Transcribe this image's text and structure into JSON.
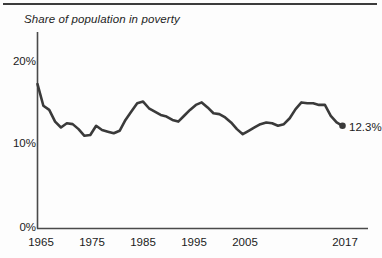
{
  "figure": {
    "title": "Share of population in poverty",
    "top_rule": "horizontal-divider",
    "background_color": "#fdfdfd",
    "line_color": "#3a3a3a",
    "axis_color": "#4a4a4a",
    "text_color": "#1b1b1b"
  },
  "annotations": {
    "end_value_label": "12.3%"
  },
  "chart_data": {
    "type": "line",
    "title": "Share of population in poverty",
    "xlabel": "",
    "ylabel": "",
    "xlim": [
      1965,
      2017
    ],
    "ylim": [
      0,
      21.5
    ],
    "grid": false,
    "legend": null,
    "x_tick_labels": [
      "1965",
      "1975",
      "1985",
      "1995",
      "2005",
      "2017"
    ],
    "x_ticks": [
      1965,
      1975,
      1985,
      1995,
      2005,
      2017
    ],
    "y_tick_labels": [
      "0%",
      "10%",
      "20%"
    ],
    "y_ticks": [
      0,
      10,
      20
    ],
    "series": [
      {
        "name": "Share of population in poverty",
        "units": "percent",
        "end_point_marker": true,
        "end_point_label": "12.3%",
        "x": [
          1965,
          1966,
          1967,
          1968,
          1969,
          1970,
          1971,
          1972,
          1973,
          1974,
          1975,
          1976,
          1977,
          1978,
          1979,
          1980,
          1981,
          1982,
          1983,
          1984,
          1985,
          1986,
          1987,
          1988,
          1989,
          1990,
          1991,
          1992,
          1993,
          1994,
          1995,
          1996,
          1997,
          1998,
          1999,
          2000,
          2001,
          2002,
          2003,
          2004,
          2005,
          2006,
          2007,
          2008,
          2009,
          2010,
          2011,
          2012,
          2013,
          2014,
          2015,
          2016,
          2017
        ],
        "values": [
          17.3,
          14.7,
          14.2,
          12.8,
          12.1,
          12.6,
          12.5,
          11.9,
          11.1,
          11.2,
          12.3,
          11.8,
          11.6,
          11.4,
          11.7,
          13.0,
          14.0,
          15.0,
          15.2,
          14.4,
          14.0,
          13.6,
          13.4,
          13.0,
          12.8,
          13.5,
          14.2,
          14.8,
          15.1,
          14.5,
          13.8,
          13.7,
          13.3,
          12.7,
          11.9,
          11.3,
          11.7,
          12.1,
          12.5,
          12.7,
          12.6,
          12.3,
          12.5,
          13.2,
          14.3,
          15.1,
          15.0,
          15.0,
          14.8,
          14.8,
          13.5,
          12.7,
          12.3
        ]
      }
    ]
  }
}
